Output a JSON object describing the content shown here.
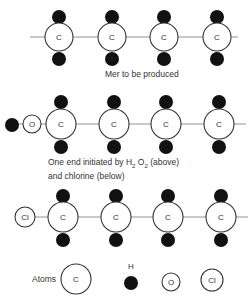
{
  "diagram": {
    "rows": [
      {
        "id": "mer",
        "caption": "Mer to be produced",
        "y": 37,
        "end_group": [],
        "carbons": [
          59,
          112,
          164,
          217
        ],
        "chain_line": [
          30,
          238
        ]
      },
      {
        "id": "initiated",
        "caption_line1_pre": "One end initiated by H",
        "caption_sub1": "2",
        "caption_mid": " O",
        "caption_sub2": "2",
        "caption_post": " (above)",
        "caption_line2": "and chlorine (below)",
        "y": 124,
        "end_group": [
          {
            "type": "H",
            "x": 12
          },
          {
            "type": "O",
            "x": 32,
            "label": "O"
          }
        ],
        "carbons": [
          61,
          114,
          166,
          219
        ],
        "chain_line": [
          41,
          246
        ]
      },
      {
        "id": "chlorine",
        "y": 217,
        "end_group": [
          {
            "type": "Cl",
            "x": 25,
            "label": "Cl"
          }
        ],
        "carbons": [
          63,
          116,
          168,
          221
        ],
        "chain_line": [
          35,
          248
        ]
      }
    ],
    "carbon_label": "C",
    "legend": {
      "title": "Atoms",
      "items": [
        {
          "type": "C",
          "label": "C"
        },
        {
          "type": "H",
          "label": "H"
        },
        {
          "type": "O",
          "label": "O"
        },
        {
          "type": "Cl",
          "label": "Cl"
        }
      ]
    },
    "colors": {
      "hydrogen": "#111111",
      "outline": "#333333",
      "bond": "#777777"
    }
  }
}
